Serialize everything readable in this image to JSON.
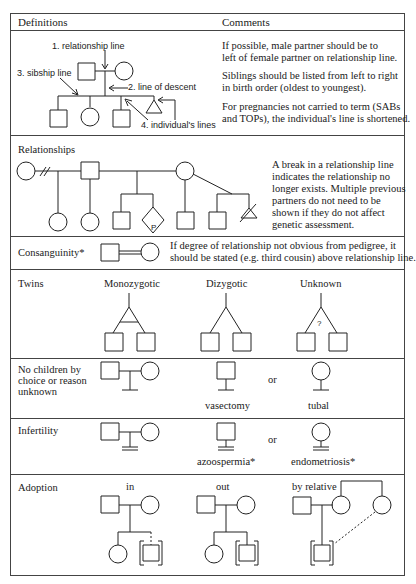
{
  "header": {
    "definitions": "Definitions",
    "comments": "Comments"
  },
  "definitions": {
    "labels": {
      "relationship_line": "1. relationship line",
      "line_of_descent": "2. line of descent",
      "sibship_line": "3. sibship line",
      "individuals_lines": "4. individual's lines"
    },
    "comments": [
      "If possible, male partner should be to",
      "left of female partner on relationship line.",
      "Siblings should be listed from left to right",
      "in birth order (oldest to youngest).",
      "For pregnancies not carried to term (SABs",
      "and TOPs), the individual's line is shortened."
    ]
  },
  "relationships": {
    "title": "Relationships",
    "diamond_label": "P",
    "comments": [
      "A break in a relationship line",
      "indicates the relationship no",
      "longer exists. Multiple previous",
      "partners do not need to be",
      "shown if they do not affect",
      "genetic assessment."
    ]
  },
  "consanguinity": {
    "title": "Consanguinity*",
    "comments": [
      "If degree of relationship not obvious from pedigree, it",
      "should be stated (e.g. third cousin) above relationship line."
    ]
  },
  "twins": {
    "title": "Twins",
    "types": [
      "Monozygotic",
      "Dizygotic",
      "Unknown"
    ],
    "unknown_mark": "?"
  },
  "no_children": {
    "title_lines": [
      "No children by",
      "choice or reason",
      "unknown"
    ],
    "or_label": "or",
    "male_caption": "vasectomy",
    "female_caption": "tubal"
  },
  "infertility": {
    "title": "Infertility",
    "or_label": "or",
    "male_caption": "azoospermia*",
    "female_caption": "endometriosis*"
  },
  "adoption": {
    "title": "Adoption",
    "types": [
      "in",
      "out",
      "by relative"
    ]
  }
}
